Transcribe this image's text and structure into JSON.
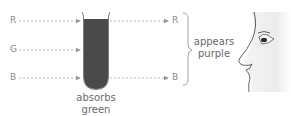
{
  "diagram": {
    "incoming_labels": {
      "red": "R",
      "green": "G",
      "blue": "B"
    },
    "outgoing_labels": {
      "red": "R",
      "blue": "B"
    },
    "tube_caption": {
      "line1": "absorbs",
      "line2": "green"
    },
    "result_caption": {
      "line1": "appears",
      "line2": "purple"
    },
    "colors": {
      "tube_fill": "#4a4a4a",
      "arrow": "#a0a0a0",
      "text": "#8a8a8a"
    }
  }
}
